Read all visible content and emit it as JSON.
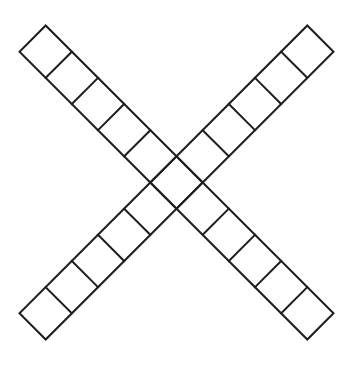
{
  "figure": {
    "background_color": "#ffffff",
    "stroke_color": "#1e1e1e",
    "stroke_width": 2,
    "canvas": {
      "width": 353,
      "height": 365
    },
    "center": {
      "x": 176.5,
      "y": 182.5
    },
    "cell_side_px": 37,
    "cells_per_strip": 11,
    "shared_center_cell": true,
    "strips": [
      {
        "name": "strip-nw-se",
        "angle_deg": 45,
        "cells": 11
      },
      {
        "name": "strip-ne-sw",
        "angle_deg": -45,
        "cells": 11
      }
    ]
  }
}
